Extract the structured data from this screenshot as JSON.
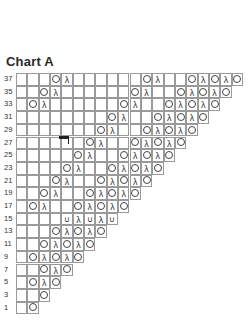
{
  "title": "Chart A",
  "symbols": {
    "O": "yarn-over",
    "λ": "decrease",
    "∪": "purl-bump",
    "": "knit"
  },
  "rows": [
    {
      "label": "37",
      "cells": [
        "",
        "",
        "",
        "O",
        "λ",
        "",
        "",
        "",
        "",
        "",
        "",
        "O",
        "λ",
        "",
        "",
        "O",
        "λ",
        "O",
        "λ",
        "O"
      ]
    },
    {
      "label": "35",
      "cells": [
        "",
        "",
        "O",
        "λ",
        "",
        "",
        "",
        "",
        "",
        "",
        "O",
        "λ",
        "",
        "",
        "O",
        "λ",
        "O",
        "λ",
        "O"
      ]
    },
    {
      "label": "33",
      "cells": [
        "",
        "O",
        "λ",
        "",
        "",
        "",
        "",
        "",
        "",
        "O",
        "λ",
        "",
        "",
        "O",
        "λ",
        "O",
        "λ",
        "O"
      ]
    },
    {
      "label": "31",
      "cells": [
        "",
        "",
        "",
        "",
        "",
        "",
        "",
        "",
        "O",
        "λ",
        "",
        "",
        "O",
        "λ",
        "O",
        "λ",
        "O"
      ]
    },
    {
      "label": "29",
      "cells": [
        "",
        "",
        "",
        "",
        "",
        "",
        "",
        "O",
        "λ",
        "",
        "",
        "O",
        "λ",
        "O",
        "λ",
        "O"
      ]
    },
    {
      "label": "27",
      "cells": [
        "",
        "",
        "",
        "",
        "",
        "",
        "O",
        "λ",
        "",
        "",
        "O",
        "λ",
        "O",
        "λ",
        "O"
      ]
    },
    {
      "label": "25",
      "cells": [
        "",
        "",
        "",
        "",
        "",
        "O",
        "λ",
        "",
        "",
        "O",
        "λ",
        "O",
        "λ",
        "O"
      ]
    },
    {
      "label": "23",
      "cells": [
        "",
        "",
        "",
        "",
        "O",
        "λ",
        "",
        "",
        "O",
        "λ",
        "O",
        "λ",
        "O"
      ]
    },
    {
      "label": "21",
      "cells": [
        "",
        "",
        "",
        "O",
        "λ",
        "",
        "",
        "O",
        "λ",
        "O",
        "λ",
        "O"
      ]
    },
    {
      "label": "19",
      "cells": [
        "",
        "",
        "O",
        "λ",
        "",
        "",
        "O",
        "λ",
        "O",
        "λ",
        "O"
      ]
    },
    {
      "label": "17",
      "cells": [
        "",
        "O",
        "λ",
        "",
        "",
        "O",
        "λ",
        "O",
        "λ",
        "O"
      ]
    },
    {
      "label": "15",
      "cells": [
        "",
        "",
        "",
        "",
        "∪",
        "λ",
        "∪",
        "λ",
        "∪"
      ]
    },
    {
      "label": "13",
      "cells": [
        "",
        "",
        "",
        "O",
        "λ",
        "O",
        "λ",
        "O"
      ]
    },
    {
      "label": "11",
      "cells": [
        "",
        "",
        "O",
        "λ",
        "O",
        "λ",
        "O"
      ]
    },
    {
      "label": "9",
      "cells": [
        "",
        "O",
        "λ",
        "O",
        "λ",
        "O"
      ]
    },
    {
      "label": "7",
      "cells": [
        "",
        "",
        "O",
        "λ",
        "O"
      ]
    },
    {
      "label": "5",
      "cells": [
        "",
        "O",
        "λ",
        "O"
      ]
    },
    {
      "label": "3",
      "cells": [
        "",
        "",
        "O"
      ]
    },
    {
      "label": "1",
      "cells": [
        "",
        "O"
      ]
    }
  ]
}
